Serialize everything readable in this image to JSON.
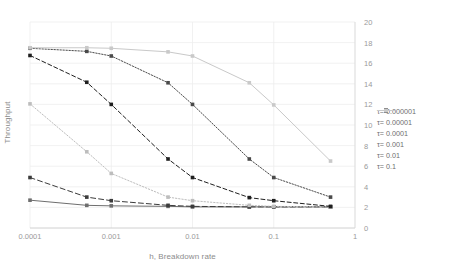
{
  "chart_data": {
    "type": "line",
    "title": "",
    "xlabel": "h, Breakdown rate",
    "ylabel": "Throughput",
    "x_scale": "log",
    "xlim": [
      0.0001,
      1
    ],
    "ylim": [
      0,
      20
    ],
    "y_axis_position": "right",
    "grid": true,
    "legend_position": "right",
    "x": [
      0.0001,
      0.0005,
      0.001,
      0.005,
      0.01,
      0.05,
      0.1,
      0.5
    ],
    "x_tick_labels": [
      "0.0001",
      "0.001",
      "0.01",
      "0.1",
      "1"
    ],
    "x_tick_values": [
      0.0001,
      0.001,
      0.01,
      0.1,
      1
    ],
    "y_tick_labels": [
      "0",
      "2",
      "4",
      "6",
      "8",
      "10",
      "12",
      "14",
      "16",
      "18",
      "20"
    ],
    "y_tick_values": [
      0,
      2,
      4,
      6,
      8,
      10,
      12,
      14,
      16,
      18,
      20
    ],
    "series": [
      {
        "name": "τ = 0.000001",
        "legend_label": "τ= 0.000001",
        "color": "#6e6e6e",
        "dash": "none",
        "marker": "square",
        "values": [
          2.7,
          2.2,
          2.15,
          2.1,
          2.05,
          2.05,
          2.05,
          2.05
        ]
      },
      {
        "name": "τ = 0.00001",
        "legend_label": "τ= 0.00001",
        "color": "#3b3b3b",
        "dash": "5,3",
        "marker": "square",
        "values": [
          4.9,
          3.0,
          2.65,
          2.2,
          2.1,
          2.05,
          2.05,
          2.05
        ]
      },
      {
        "name": "τ = 0.0001",
        "legend_label": "τ= 0.0001",
        "color": "#bdbdbd",
        "dash": "1.4,1.8",
        "marker": "square",
        "values": [
          12.05,
          7.4,
          5.3,
          3.0,
          2.65,
          2.2,
          2.1,
          2.05
        ]
      },
      {
        "name": "τ = 0.001",
        "legend_label": "τ= 0.001",
        "color": "#1f1f1f",
        "dash": "4,2.6",
        "marker": "square",
        "values": [
          16.75,
          14.15,
          12.0,
          6.7,
          4.9,
          2.95,
          2.65,
          2.1
        ]
      },
      {
        "name": "τ = 0.01",
        "legend_label": "τ= 0.01",
        "color": "#4a4a4a",
        "dash": "1.4,1.6",
        "marker": "square",
        "values": [
          17.45,
          17.15,
          16.7,
          14.1,
          12.0,
          6.7,
          4.9,
          3.0
        ]
      },
      {
        "name": "τ = 0.1",
        "legend_label": "τ= 0.1",
        "color": "#c9c9c9",
        "dash": "none",
        "marker": "square",
        "values": [
          17.5,
          17.5,
          17.45,
          17.1,
          16.7,
          14.1,
          11.95,
          6.5
        ]
      }
    ]
  }
}
